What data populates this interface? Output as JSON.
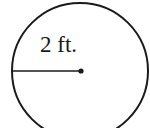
{
  "diagram": {
    "type": "circle-with-radius",
    "radius_label": "2 ft.",
    "shape": "circle",
    "radius_value": 2,
    "radius_unit": "ft",
    "stroke_color": "#1a1a1a",
    "background_color": "#ffffff"
  }
}
